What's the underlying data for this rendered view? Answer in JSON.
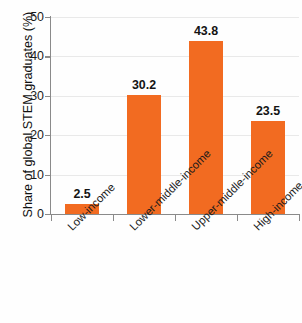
{
  "chart_data": {
    "type": "bar",
    "title": "",
    "xlabel": "",
    "ylabel": "Share of global STEM graduates (%)",
    "categories": [
      "Low-income",
      "Lower-middle-income",
      "Upper-middle-income",
      "High-income"
    ],
    "values": [
      2.5,
      30.2,
      43.8,
      23.5
    ],
    "value_labels": [
      "2.5",
      "30.2",
      "43.8",
      "23.5"
    ],
    "ylim": [
      0,
      50
    ],
    "ytick_labels": [
      "0",
      "10",
      "20",
      "30",
      "40",
      "50"
    ],
    "ytick_values": [
      0,
      10,
      20,
      30,
      40,
      50
    ],
    "grid": true,
    "legend": false,
    "bar_color": "#f26b21",
    "gridline_color": "#e9e9e9",
    "axis_color": "#8a8a8a",
    "text_color": "#1a1a1a"
  },
  "cropped_title_fragment": ""
}
